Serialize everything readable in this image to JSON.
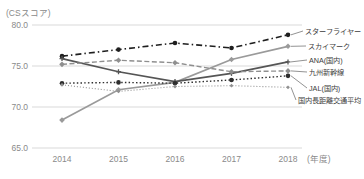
{
  "chart_data": {
    "type": "line",
    "title": "(CSスコア)",
    "x_axis_suffix": "(年度)",
    "categories": [
      "2014",
      "2015",
      "2016",
      "2017",
      "2018"
    ],
    "ylim": [
      65.0,
      80.0
    ],
    "ytick_labels": [
      "80.0",
      "75.0",
      "70.0",
      "65.0"
    ],
    "ytick_values": [
      80.0,
      75.0,
      70.0,
      65.0
    ],
    "grid": "horizontal-only",
    "legend_position": "right-callouts",
    "series": [
      {
        "name": "スターフライヤー",
        "values": [
          76.2,
          77.0,
          77.8,
          77.2,
          78.8
        ],
        "color": "#1f1f1f",
        "style": "dash-dot",
        "marker": "circle"
      },
      {
        "name": "スカイマーク",
        "values": [
          68.4,
          72.1,
          73.0,
          75.8,
          77.4
        ],
        "color": "#9a9a9a",
        "style": "solid",
        "marker": "diamond"
      },
      {
        "name": "ANA(国内)",
        "values": [
          75.9,
          74.3,
          73.1,
          74.1,
          75.5
        ],
        "color": "#555555",
        "style": "solid",
        "marker": "plus"
      },
      {
        "name": "九州新幹線",
        "values": [
          75.2,
          75.7,
          75.4,
          74.3,
          74.4
        ],
        "color": "#8f8f8f",
        "style": "dashed",
        "marker": "diamond"
      },
      {
        "name": "JAL(国内)",
        "values": [
          72.9,
          73.0,
          72.9,
          73.3,
          73.8
        ],
        "color": "#2e2e2e",
        "style": "dotted",
        "marker": "circle"
      },
      {
        "name": "国内長距離交通平均",
        "values": [
          72.7,
          71.9,
          72.5,
          72.6,
          72.4
        ],
        "color": "#909090",
        "style": "fine-dotted",
        "marker": "diamond-small"
      }
    ],
    "colors": {
      "grid": "#d9d9d9",
      "axis_text": "#8a8a8a",
      "legend_text": "#3c3c3c",
      "callout_line": "#777777",
      "background": "#ffffff"
    }
  }
}
